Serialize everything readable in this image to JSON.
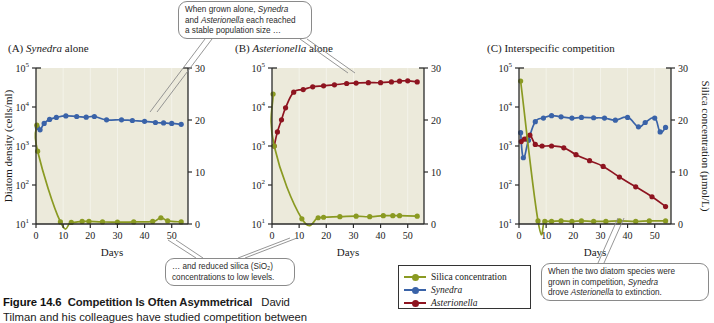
{
  "figure": {
    "caption_label": "Figure 14.6",
    "caption_title": "Competition Is Often Asymmetrical",
    "caption_author": "David",
    "caption_line2": "Tilman and his colleagues have studied competition between"
  },
  "panels": [
    {
      "letter": "(A)",
      "title_italic": "Synedra",
      "title_rest": "alone"
    },
    {
      "letter": "(B)",
      "title_italic": "Asterionella",
      "title_rest": "alone"
    },
    {
      "letter": "(C)",
      "title_italic": "",
      "title_rest": "Interspecific competition"
    }
  ],
  "axes": {
    "y_left_title": "Diatom density (cells/ml)",
    "y_right_title": "Silica concentration (µmol/L)",
    "x_title": "Days",
    "y_left_ticks": [
      "10",
      "10",
      "10",
      "10",
      "10"
    ],
    "y_left_exponents": [
      "1",
      "2",
      "3",
      "4",
      "5"
    ],
    "y_right_ticks": [
      "0",
      "10",
      "20",
      "30"
    ],
    "x_ticks": [
      "0",
      "10",
      "20",
      "30",
      "40",
      "50"
    ],
    "x_min": 0,
    "x_max": 56,
    "y_left_min_exp": 1,
    "y_left_max_exp": 5,
    "y_right_min": 0,
    "y_right_max": 30
  },
  "colors": {
    "silica": "#8a9a22",
    "synedra": "#3a63a8",
    "asterionella": "#8e1420",
    "plot_background": "#eceadb",
    "axis": "#2a2a2a",
    "callout_border": "#8a8a8a"
  },
  "legend": {
    "items": [
      {
        "label": "Silica concentration",
        "color_key": "silica",
        "italic": false
      },
      {
        "label": "Synedra",
        "color_key": "synedra",
        "italic": true
      },
      {
        "label": "Asterionella",
        "color_key": "asterionella",
        "italic": true
      }
    ]
  },
  "callouts": {
    "top": {
      "line1_a": "When grown alone, ",
      "line1_i": "Synedra",
      "line2_a": "and ",
      "line2_i": "Asterionella",
      "line2_b": " each reached",
      "line3": "a stable population size …"
    },
    "bottom_left": {
      "line1": "… and reduced silica (SiO₂)",
      "line2": "concentrations to low levels."
    },
    "bottom_right": {
      "line1": "When the two diatom species were",
      "line2_a": "grown in competition, ",
      "line2_i": "Synedra",
      "line3_a": "drove ",
      "line3_i": "Asterionella",
      "line3_b": " to extinction."
    }
  },
  "chart_data": [
    {
      "type": "line",
      "title": "(A) Synedra alone",
      "xlabel": "Days",
      "ylabel": "Diatom density (cells/ml)",
      "ylabel_right": "Silica concentration (µmol/L)",
      "xlim": [
        0,
        56
      ],
      "ylim_log": [
        10,
        100000
      ],
      "ylim_right": [
        0,
        30
      ],
      "grid": false,
      "series": [
        {
          "name": "Synedra",
          "axis": "left-log",
          "color": "#3a63a8",
          "points": [
            {
              "x": 0.5,
              "y": 3000
            },
            {
              "x": 1.5,
              "y": 2600
            },
            {
              "x": 3,
              "y": 3800
            },
            {
              "x": 5,
              "y": 4800
            },
            {
              "x": 7.5,
              "y": 5400
            },
            {
              "x": 11,
              "y": 5900
            },
            {
              "x": 15,
              "y": 5700
            },
            {
              "x": 18.5,
              "y": 5500
            },
            {
              "x": 21.5,
              "y": 5700
            },
            {
              "x": 26,
              "y": 4700
            },
            {
              "x": 31.5,
              "y": 4700
            },
            {
              "x": 35.5,
              "y": 4500
            },
            {
              "x": 40,
              "y": 4300
            },
            {
              "x": 44,
              "y": 4000
            },
            {
              "x": 47,
              "y": 3900
            },
            {
              "x": 50,
              "y": 3800
            },
            {
              "x": 53.5,
              "y": 3600
            }
          ]
        },
        {
          "name": "Silica concentration",
          "axis": "right-linear",
          "color": "#8a9a22",
          "points": [
            {
              "x": 0.3,
              "y": 19.0
            },
            {
              "x": 0.6,
              "y": 14.0
            },
            {
              "x": 9,
              "y": 0.4
            },
            {
              "x": 13,
              "y": 0.3
            },
            {
              "x": 17,
              "y": 0.5
            },
            {
              "x": 19.5,
              "y": 0.5
            },
            {
              "x": 24.5,
              "y": 0.4
            },
            {
              "x": 30,
              "y": 0.35
            },
            {
              "x": 36,
              "y": 0.4
            },
            {
              "x": 43,
              "y": 0.5
            },
            {
              "x": 46,
              "y": 1.2
            },
            {
              "x": 48.5,
              "y": 0.6
            },
            {
              "x": 53.5,
              "y": 0.4
            }
          ]
        }
      ]
    },
    {
      "type": "line",
      "title": "(B) Asterionella alone",
      "xlabel": "Days",
      "ylabel": "Diatom density (cells/ml)",
      "ylabel_right": "Silica concentration (µmol/L)",
      "xlim": [
        0,
        56
      ],
      "ylim_log": [
        10,
        100000
      ],
      "ylim_right": [
        0,
        30
      ],
      "grid": false,
      "series": [
        {
          "name": "Asterionella",
          "axis": "left-log",
          "color": "#8e1420",
          "points": [
            {
              "x": 0.8,
              "y": 1000
            },
            {
              "x": 2,
              "y": 2300
            },
            {
              "x": 3.5,
              "y": 4700
            },
            {
              "x": 5,
              "y": 9500
            },
            {
              "x": 8,
              "y": 24000
            },
            {
              "x": 11.5,
              "y": 28000
            },
            {
              "x": 15,
              "y": 33000
            },
            {
              "x": 19,
              "y": 35000
            },
            {
              "x": 23,
              "y": 37000
            },
            {
              "x": 27.5,
              "y": 40000
            },
            {
              "x": 31,
              "y": 41000
            },
            {
              "x": 35.5,
              "y": 42000
            },
            {
              "x": 40,
              "y": 42000
            },
            {
              "x": 44,
              "y": 44000
            },
            {
              "x": 47,
              "y": 46000
            },
            {
              "x": 50,
              "y": 47000
            },
            {
              "x": 53.5,
              "y": 44000
            }
          ]
        },
        {
          "name": "Silica concentration",
          "axis": "right-linear",
          "color": "#8a9a22",
          "points": [
            {
              "x": 0.4,
              "y": 25.0
            },
            {
              "x": 0.8,
              "y": 15.0
            },
            {
              "x": 11,
              "y": 1.0
            },
            {
              "x": 17,
              "y": 1.2
            },
            {
              "x": 19,
              "y": 1.3
            },
            {
              "x": 25,
              "y": 1.4
            },
            {
              "x": 31,
              "y": 1.5
            },
            {
              "x": 36,
              "y": 1.4
            },
            {
              "x": 41,
              "y": 1.6
            },
            {
              "x": 44.5,
              "y": 1.6
            },
            {
              "x": 47,
              "y": 1.6
            },
            {
              "x": 53.5,
              "y": 1.5
            }
          ]
        }
      ]
    },
    {
      "type": "line",
      "title": "(C) Interspecific competition",
      "xlabel": "Days",
      "ylabel": "Diatom density (cells/ml)",
      "ylabel_right": "Silica concentration (µmol/L)",
      "xlim": [
        0,
        56
      ],
      "ylim_log": [
        10,
        100000
      ],
      "ylim_right": [
        0,
        30
      ],
      "grid": false,
      "series": [
        {
          "name": "Synedra",
          "axis": "left-log",
          "color": "#3a63a8",
          "points": [
            {
              "x": 0.6,
              "y": 2200
            },
            {
              "x": 1.6,
              "y": 500
            },
            {
              "x": 3.5,
              "y": 1400
            },
            {
              "x": 6,
              "y": 4200
            },
            {
              "x": 9,
              "y": 5200
            },
            {
              "x": 12,
              "y": 6000
            },
            {
              "x": 15.5,
              "y": 5600
            },
            {
              "x": 19.5,
              "y": 5200
            },
            {
              "x": 23,
              "y": 5400
            },
            {
              "x": 27.5,
              "y": 5300
            },
            {
              "x": 31.5,
              "y": 5200
            },
            {
              "x": 35.5,
              "y": 4600
            },
            {
              "x": 40,
              "y": 5400
            },
            {
              "x": 44,
              "y": 3100
            },
            {
              "x": 46.5,
              "y": 4000
            },
            {
              "x": 50,
              "y": 5200
            },
            {
              "x": 52,
              "y": 2300
            },
            {
              "x": 54,
              "y": 3000
            }
          ]
        },
        {
          "name": "Asterionella",
          "axis": "left-log",
          "color": "#8e1420",
          "points": [
            {
              "x": 0.8,
              "y": 1300
            },
            {
              "x": 2,
              "y": 1500
            },
            {
              "x": 4,
              "y": 1900
            },
            {
              "x": 6,
              "y": 1100
            },
            {
              "x": 8.5,
              "y": 1000
            },
            {
              "x": 12,
              "y": 1000
            },
            {
              "x": 16.5,
              "y": 900
            },
            {
              "x": 21,
              "y": 600
            },
            {
              "x": 26,
              "y": 420
            },
            {
              "x": 31,
              "y": 300
            },
            {
              "x": 37,
              "y": 160
            },
            {
              "x": 43,
              "y": 90
            },
            {
              "x": 49,
              "y": 50
            },
            {
              "x": 54,
              "y": 28
            }
          ]
        },
        {
          "name": "Silica concentration",
          "axis": "right-linear",
          "color": "#8a9a22",
          "points": [
            {
              "x": 0.6,
              "y": 27.5
            },
            {
              "x": 7,
              "y": 0.6
            },
            {
              "x": 9.5,
              "y": 0.5
            },
            {
              "x": 12,
              "y": 0.5
            },
            {
              "x": 15.5,
              "y": 0.6
            },
            {
              "x": 19.5,
              "y": 0.5
            },
            {
              "x": 23,
              "y": 0.6
            },
            {
              "x": 27.5,
              "y": 0.5
            },
            {
              "x": 32,
              "y": 0.5
            },
            {
              "x": 37,
              "y": 0.6
            },
            {
              "x": 43,
              "y": 0.5
            },
            {
              "x": 48,
              "y": 0.6
            },
            {
              "x": 54,
              "y": 0.6
            }
          ]
        }
      ]
    }
  ]
}
